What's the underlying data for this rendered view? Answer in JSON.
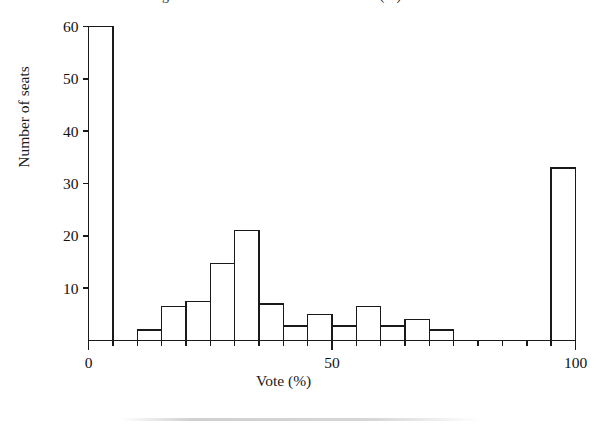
{
  "figure": {
    "caption_partial": "Figure 1. Distribution of the vote share (%)",
    "ylabel": "Number of seats",
    "xlabel": "Vote (%)",
    "y_ticks": [
      "0",
      "10",
      "20",
      "30",
      "40",
      "50",
      "60"
    ],
    "x_ticks": [
      "0",
      "50",
      "100"
    ],
    "line_color": "#1a1a1a",
    "bar_fill": "#ffffff",
    "background": "#ffffff"
  },
  "chart_data": {
    "type": "bar",
    "title": "",
    "subtitle": "",
    "xlabel": "Vote (%)",
    "ylabel": "Number of seats",
    "xlim": [
      0,
      100
    ],
    "ylim": [
      0,
      60
    ],
    "grid": false,
    "legend": null,
    "bin_width": 5,
    "bin_starts": [
      0,
      5,
      10,
      15,
      20,
      25,
      30,
      35,
      40,
      45,
      50,
      55,
      60,
      65,
      70,
      75,
      80,
      85,
      90,
      95
    ],
    "categories": [
      "0-5",
      "5-10",
      "10-15",
      "15-20",
      "20-25",
      "25-30",
      "30-35",
      "35-40",
      "40-45",
      "45-50",
      "50-55",
      "55-60",
      "60-65",
      "65-70",
      "70-75",
      "75-80",
      "80-85",
      "85-90",
      "90-95",
      "95-100"
    ],
    "values": [
      60,
      0,
      2,
      6.5,
      7.5,
      14.7,
      21,
      7,
      2.8,
      5,
      2.8,
      6.5,
      2.8,
      4,
      2,
      0,
      0,
      0,
      0,
      33
    ],
    "x_tick_values": [
      0,
      50,
      100
    ],
    "x_minor_tick_step": 5,
    "y_tick_values": [
      0,
      10,
      20,
      30,
      40,
      50,
      60
    ],
    "annotations": []
  }
}
